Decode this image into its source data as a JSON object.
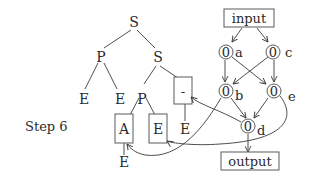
{
  "step_label": "Step 6",
  "parse_tree": {
    "root": "S",
    "nodes": {
      "s_root": "S",
      "p_left": "P",
      "s_right": "S",
      "e_ll": "E",
      "e_lr": "E",
      "p_mid": "P",
      "dash_box": "-",
      "a_box": "A",
      "e_box": "E",
      "e_under_dash": "E",
      "e_under_a": "E"
    }
  },
  "flow_graph": {
    "input_label": "input",
    "output_label": "output",
    "nodes": [
      {
        "id": "a",
        "value": "0",
        "label": "a"
      },
      {
        "id": "c",
        "value": "0",
        "label": "c"
      },
      {
        "id": "b",
        "value": "0",
        "label": "b"
      },
      {
        "id": "e",
        "value": "0",
        "label": "e"
      },
      {
        "id": "d",
        "value": "0",
        "label": "d"
      }
    ]
  },
  "colors": {
    "stroke": "#3a3a3a",
    "text": "#2a2a2a",
    "background": "#ffffff"
  }
}
